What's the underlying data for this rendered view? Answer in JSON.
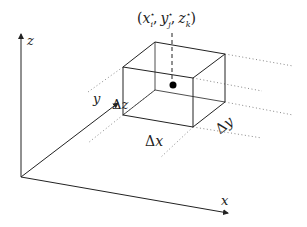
{
  "diagram": {
    "type": "3d-axes-with-box",
    "axes": {
      "x": {
        "label": "x"
      },
      "y": {
        "label": "y"
      },
      "z": {
        "label": "z"
      }
    },
    "point_label": "(x*_i, y*_j, z*_k)",
    "point_label_parts": {
      "open": "(",
      "x": "x",
      "x_sup": "⋆",
      "x_sub": "i",
      "y": "y",
      "y_sup": "⋆",
      "y_sub": "j",
      "z": "z",
      "z_sup": "⋆",
      "z_sub": "k",
      "comma": ",",
      "close": ")"
    },
    "box_dimensions": {
      "dx": {
        "delta": "Δ",
        "var": "x"
      },
      "dy": {
        "delta": "Δ",
        "var": "y"
      },
      "dz": {
        "delta": "Δ",
        "var": "z"
      }
    },
    "colors": {
      "stroke": "#222222",
      "dotted": "#888888",
      "point": "#000000"
    }
  }
}
